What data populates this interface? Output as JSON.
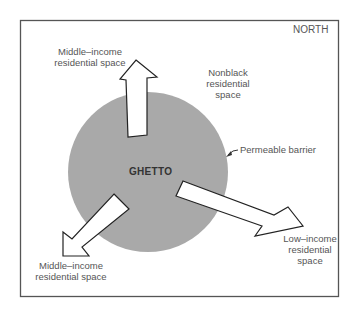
{
  "diagram": {
    "title": "",
    "orientation_label": "NORTH",
    "core": {
      "label": "GHETTO",
      "fill": "#a9a9a9"
    },
    "boundary_label": "Permeable barrier",
    "regions": [
      {
        "id": "middle-income-north",
        "line1": "Middle–income",
        "line2": "residential space"
      },
      {
        "id": "nonblack",
        "line1": "Nonblack",
        "line2": "residential",
        "line3": "space"
      },
      {
        "id": "middle-income-southwest",
        "line1": "Middle–income",
        "line2": "residential space"
      },
      {
        "id": "low-income-southeast",
        "line1": "Low–income",
        "line2": "residential",
        "line3": "space"
      }
    ],
    "arrows": [
      {
        "id": "arrow-north",
        "direction": "north",
        "target": "Middle-income residential space"
      },
      {
        "id": "arrow-southwest",
        "direction": "southwest",
        "target": "Middle-income residential space"
      },
      {
        "id": "arrow-southeast",
        "direction": "southeast",
        "target": "Low-income residential space"
      }
    ],
    "colors": {
      "frame": "#555555",
      "circle": "#a9a9a9",
      "arrow_fill": "#ffffff",
      "arrow_stroke": "#222222",
      "text": "#555555"
    }
  }
}
